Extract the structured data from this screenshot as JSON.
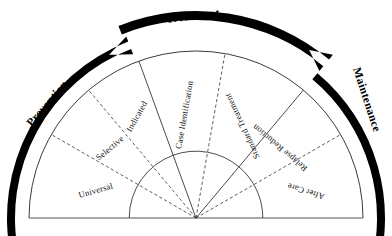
{
  "figure": {
    "title_visible": false,
    "geometry": {
      "center_x": 196,
      "center_y": 218,
      "radius": 167,
      "start_angle_deg": 180,
      "end_angle_deg": 0
    },
    "colors": {
      "stroke": "#2a2a2a",
      "outline": "#3a3a3a",
      "arrow": "#000000",
      "text": "#111111",
      "background": "#ffffff"
    }
  },
  "chart_data": {
    "type": "pie",
    "title": "",
    "xlabel": "",
    "ylabel": "",
    "legend_position": "none",
    "grid": false,
    "categories": [
      "Universal",
      "Selective",
      "Indicated",
      "Case Identification",
      "Standard Treatment",
      "Relapse Reduction",
      "After Care"
    ],
    "values": [
      30,
      20,
      20,
      30,
      30,
      20,
      30
    ],
    "groups": [
      "Prevention",
      "Treatment",
      "Maintenance"
    ]
  },
  "wedges": [
    {
      "id": "universal",
      "label": "Universal",
      "a0": 180,
      "a1": 150,
      "divider_after": "dashed",
      "label_r": 0.62,
      "label_a": 165,
      "rot": -16
    },
    {
      "id": "selective",
      "label": "Selective",
      "a0": 150,
      "a1": 130,
      "divider_after": "dashed",
      "label_r": 0.66,
      "label_a": 141,
      "rot": -40
    },
    {
      "id": "indicated",
      "label": "Indicated",
      "a0": 130,
      "a1": 110,
      "divider_after": "solid",
      "label_r": 0.7,
      "label_a": 120,
      "rot": -61
    },
    {
      "id": "case-identification",
      "label": "Case Identification",
      "a0": 110,
      "a1": 80,
      "divider_after": "dashed",
      "label_r": 0.62,
      "label_a": 96,
      "rot": -80
    },
    {
      "id": "standard-treatment",
      "label": "Standard Treatment",
      "a0": 80,
      "a1": 50,
      "divider_after": "solid",
      "label_r": 0.62,
      "label_a": 63,
      "rot": -115
    },
    {
      "id": "relapse-reduction",
      "label": "Relapse Reduction",
      "a0": 50,
      "a1": 30,
      "divider_after": "dashed",
      "label_r": 0.66,
      "label_a": 40,
      "rot": -140
    },
    {
      "id": "after-care",
      "label": "After Care",
      "a0": 30,
      "a1": 0,
      "divider_after": "none",
      "label_r": 0.68,
      "label_a": 14,
      "rot": -163
    }
  ],
  "phases": [
    {
      "id": "prevention",
      "label": "Prevention",
      "rotation_deg": -49,
      "x": 48,
      "y": 104
    },
    {
      "id": "treatment",
      "label": "Treatment",
      "rotation_deg": -7,
      "x": 193,
      "y": 17
    },
    {
      "id": "maintenance",
      "label": "Maintenance",
      "rotation_deg": 72,
      "x": 366,
      "y": 100
    }
  ],
  "arrows": [
    {
      "id": "prevention-arrow",
      "direction": "clockwise-up-right"
    },
    {
      "id": "treatment-arrow",
      "direction": "left-to-right-over-top"
    },
    {
      "id": "maintenance-arrow",
      "direction": "clockwise-down"
    }
  ]
}
